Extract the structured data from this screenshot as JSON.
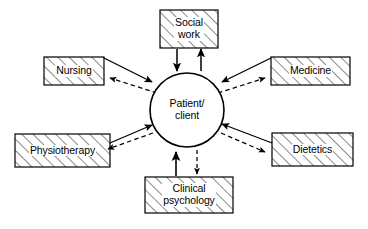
{
  "figure": {
    "background_color": "#ffffff",
    "line_color": "#000000",
    "hatch_color": "#333333"
  },
  "center": {
    "name": "patient-client",
    "label": "Patient/\nclient",
    "shape": "circle",
    "cx": 187,
    "cy": 110,
    "r": 37
  },
  "nodes": [
    {
      "id": "social-work",
      "label": "Social\nwork",
      "position": "top",
      "box": {
        "x": 160,
        "y": 10,
        "w": 58,
        "h": 38
      },
      "inbound_arrow": "solid",
      "outbound_arrow": "solid"
    },
    {
      "id": "nursing",
      "label": "Nursing",
      "position": "top-left",
      "box": {
        "x": 44,
        "y": 57,
        "w": 60,
        "h": 28
      },
      "inbound_arrow": "solid",
      "outbound_arrow": "dashed"
    },
    {
      "id": "medicine",
      "label": "Medicine",
      "position": "top-right",
      "box": {
        "x": 271,
        "y": 57,
        "w": 79,
        "h": 28
      },
      "inbound_arrow": "solid",
      "outbound_arrow": "dashed"
    },
    {
      "id": "physiotherapy",
      "label": "Physiotherapy",
      "position": "bottom-left",
      "box": {
        "x": 15,
        "y": 134,
        "w": 95,
        "h": 33
      },
      "inbound_arrow": "solid",
      "outbound_arrow": "dashed"
    },
    {
      "id": "dietetics",
      "label": "Dietetics",
      "position": "bottom-right",
      "box": {
        "x": 272,
        "y": 133,
        "w": 81,
        "h": 33
      },
      "inbound_arrow": "solid",
      "outbound_arrow": "dashed"
    },
    {
      "id": "clinical-psychology",
      "label": "Clinical\npsychology",
      "position": "bottom",
      "box": {
        "x": 145,
        "y": 177,
        "w": 88,
        "h": 36
      },
      "inbound_arrow": "solid",
      "outbound_arrow": "dashed"
    }
  ]
}
